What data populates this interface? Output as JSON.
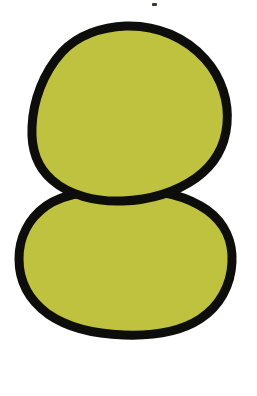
{
  "canvas": {
    "width": 257,
    "height": 396,
    "background_color": "#FFFFFF",
    "title": "Two stacked olive-green blobs"
  },
  "palette": {
    "fill": "#BFC23E",
    "outline": "#0D0D0B",
    "background": "#FFFFFF",
    "speck": "#3A3A34"
  },
  "shapes": {
    "upper_blob": {
      "name": "upper-blob",
      "fill_color": "#BFC23E",
      "outline_color": "#0D0D0B",
      "outline_width": 9,
      "bounds": {
        "x": 31,
        "y": 24,
        "width": 197,
        "height": 181
      },
      "path": "M 126 26 C 158 25 186 38 205 59 C 222 78 229 102 227 124 C 225 146 214 165 196 178 C 176 192 150 200 122 201 C 95 202 69 195 52 180 C 37 167 31 148 32 127 C 33 101 43 73 62 52 C 78 35 102 27 126 26 Z"
    },
    "lower_blob": {
      "name": "lower-blob",
      "fill_color": "#BFC23E",
      "outline_color": "#0D0D0B",
      "outline_width": 9,
      "bounds": {
        "x": 18,
        "y": 186,
        "width": 216,
        "height": 148
      },
      "path": "M 124 190 C 156 189 186 195 207 210 C 225 223 233 242 232 262 C 231 285 220 306 200 319 C 180 332 152 336 124 335 C 95 334 68 328 48 314 C 29 300 19 281 19 259 C 19 238 28 219 46 206 C 66 192 96 190 124 190 Z"
    },
    "speck": {
      "name": "ink-speck",
      "color": "#3A3A34",
      "x": 152,
      "y": 3,
      "width": 5,
      "height": 3
    }
  }
}
